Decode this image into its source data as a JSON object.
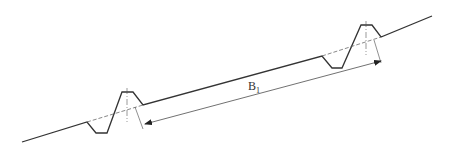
{
  "diagram": {
    "type": "terrace-cross-section",
    "dimension_label": "B",
    "dimension_subscript": "1",
    "line_color": "#333333",
    "background": "#ffffff"
  }
}
